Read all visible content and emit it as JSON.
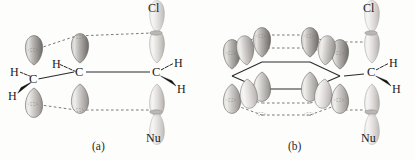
{
  "figure": {
    "background_color": "#fdfdfc",
    "ink_color": "#1a1a1a",
    "orbital_fill_light": "#d8d6d4",
    "orbital_fill_mid": "#a9a6a3",
    "orbital_fill_dark": "#6f6c69",
    "dashed_line_color": "#6b6b6b",
    "bond_line_color": "#2b2b2b"
  },
  "panels": [
    {
      "id": "a",
      "caption": "(a)",
      "description": "allylic three p-orbital system attached to reacting carbon",
      "p_orbital_count": 3,
      "reacting_center": {
        "carbon_label": "C",
        "top_group_label": "Cl",
        "bottom_group_label": "Nu",
        "hydrogens": [
          {
            "label": "H",
            "bond_style": "hashed-wedge",
            "position": "upper-right"
          },
          {
            "label": "H",
            "bond_style": "solid-wedge",
            "position": "lower-right"
          }
        ]
      },
      "carbons": [
        {
          "label": "C",
          "hydrogens": [
            {
              "label": "H",
              "bond_style": "hashed-wedge",
              "position": "upper-left"
            },
            {
              "label": "H",
              "bond_style": "solid-wedge",
              "position": "lower-left"
            }
          ]
        },
        {
          "label": "C",
          "hydrogens": [
            {
              "label": "H",
              "bond_style": "hashed-wedge",
              "position": "upper-left"
            }
          ]
        }
      ]
    },
    {
      "id": "b",
      "caption": "(b)",
      "description": "benzylic six p-orbital aromatic ring attached to reacting carbon",
      "p_orbital_count": 6,
      "reacting_center": {
        "carbon_label": "C",
        "top_group_label": "Cl",
        "bottom_group_label": "Nu",
        "hydrogens": [
          {
            "label": "H",
            "bond_style": "hashed-wedge",
            "position": "upper-right"
          },
          {
            "label": "H",
            "bond_style": "solid-wedge",
            "position": "lower-right"
          }
        ]
      },
      "carbons": []
    }
  ],
  "labels": {
    "chlorine": "Cl",
    "nucleophile": "Nu",
    "hydrogen": "H",
    "carbon": "C",
    "caption_a": "(a)",
    "caption_b": "(b)"
  }
}
